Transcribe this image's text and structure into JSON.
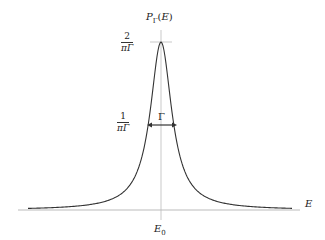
{
  "diagram": {
    "y_axis_label": "P_Γ(E)",
    "y_axis_label_main": "P",
    "y_axis_label_sub": "Γ",
    "y_axis_label_arg": "(E)",
    "x_axis_label": "E",
    "center_label_main": "E",
    "center_label_sub": "0",
    "peak_value": {
      "numerator": "2",
      "denominator": "πΓ"
    },
    "half_max_value": {
      "numerator": "1",
      "denominator": "πΓ"
    },
    "width_label": "Γ",
    "colors": {
      "curve": "#333333",
      "axis": "#aaaaaa",
      "center_line": "#bbbbbb",
      "arrow": "#333333"
    }
  }
}
